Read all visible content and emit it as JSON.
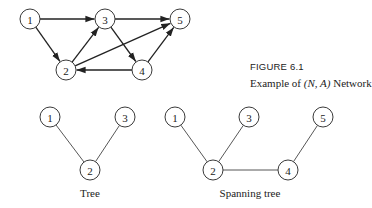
{
  "figure": {
    "number_label": "FIGURE 6.1",
    "caption_prefix": "Example of ",
    "caption_math": "(N, A)",
    "caption_suffix": " Network"
  },
  "network": {
    "nodes": [
      {
        "id": "1",
        "x": 30,
        "y": 19
      },
      {
        "id": "2",
        "x": 66,
        "y": 70
      },
      {
        "id": "3",
        "x": 105,
        "y": 19
      },
      {
        "id": "4",
        "x": 142,
        "y": 70
      },
      {
        "id": "5",
        "x": 180,
        "y": 19
      }
    ],
    "arcs": [
      {
        "from": "1",
        "to": "3"
      },
      {
        "from": "1",
        "to": "2"
      },
      {
        "from": "2",
        "to": "3"
      },
      {
        "from": "2",
        "to": "5"
      },
      {
        "from": "3",
        "to": "5"
      },
      {
        "from": "3",
        "to": "4"
      },
      {
        "from": "4",
        "to": "5"
      },
      {
        "from": "4",
        "to": "2"
      }
    ]
  },
  "tree": {
    "label": "Tree",
    "nodes": [
      {
        "id": "1",
        "x": 50,
        "y": 117
      },
      {
        "id": "3",
        "x": 125,
        "y": 117
      },
      {
        "id": "2",
        "x": 90,
        "y": 170
      }
    ],
    "edges": [
      {
        "from": "1",
        "to": "2"
      },
      {
        "from": "3",
        "to": "2"
      }
    ]
  },
  "spanning_tree": {
    "label": "Spanning tree",
    "nodes": [
      {
        "id": "1",
        "x": 175,
        "y": 117
      },
      {
        "id": "3",
        "x": 249,
        "y": 117
      },
      {
        "id": "5",
        "x": 323,
        "y": 117
      },
      {
        "id": "2",
        "x": 213,
        "y": 170
      },
      {
        "id": "4",
        "x": 288,
        "y": 170
      }
    ],
    "edges": [
      {
        "from": "1",
        "to": "2"
      },
      {
        "from": "3",
        "to": "2"
      },
      {
        "from": "2",
        "to": "4"
      },
      {
        "from": "5",
        "to": "4"
      }
    ]
  }
}
